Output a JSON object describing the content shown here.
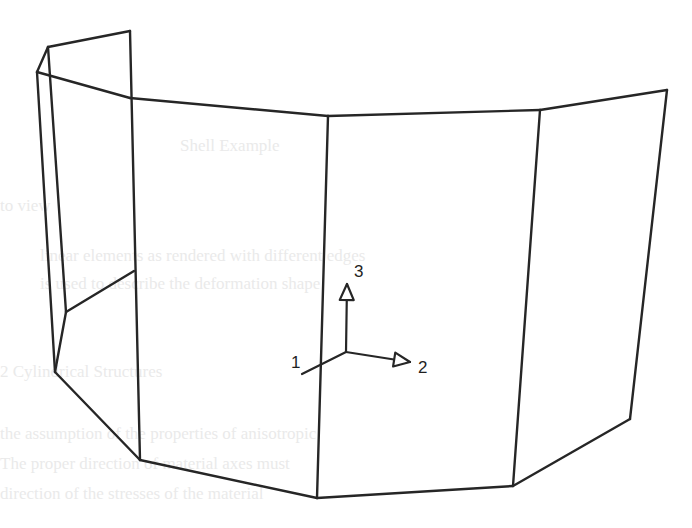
{
  "figure": {
    "type": "wireframe-3d-shell",
    "colors": {
      "line": "#262626",
      "background": "#ffffff",
      "bleed_through_text": "#d9d9d9"
    },
    "axis_triad": {
      "origin": [
        346,
        352
      ],
      "axes": [
        {
          "id": "axis-1",
          "label": "1",
          "end": [
            302,
            374
          ],
          "label_pos": [
            291,
            368
          ]
        },
        {
          "id": "axis-2",
          "label": "2",
          "end": [
            410,
            362
          ],
          "label_pos": [
            418,
            373
          ]
        },
        {
          "id": "axis-3",
          "label": "3",
          "end": [
            347,
            284
          ],
          "label_pos": [
            354,
            277
          ]
        }
      ]
    },
    "edges": [
      {
        "id": "top-flap-left",
        "points": [
          [
            37,
            72
          ],
          [
            48,
            47
          ]
        ]
      },
      {
        "id": "top-flap",
        "points": [
          [
            48,
            47
          ],
          [
            130,
            31
          ]
        ]
      },
      {
        "id": "top-edge-1",
        "points": [
          [
            37,
            72
          ],
          [
            130,
            98
          ]
        ]
      },
      {
        "id": "top-edge-2",
        "points": [
          [
            130,
            98
          ],
          [
            328,
            116
          ]
        ]
      },
      {
        "id": "top-edge-3",
        "points": [
          [
            328,
            116
          ],
          [
            540,
            110
          ]
        ]
      },
      {
        "id": "top-edge-4",
        "points": [
          [
            540,
            110
          ],
          [
            667,
            90
          ]
        ]
      },
      {
        "id": "vertical-0",
        "points": [
          [
            37,
            72
          ],
          [
            55,
            372
          ]
        ]
      },
      {
        "id": "vertical-0b",
        "points": [
          [
            48,
            47
          ],
          [
            66,
            312
          ]
        ]
      },
      {
        "id": "vertical-1",
        "points": [
          [
            130,
            31
          ],
          [
            140,
            460
          ]
        ]
      },
      {
        "id": "vertical-2",
        "points": [
          [
            328,
            116
          ],
          [
            317,
            498
          ]
        ]
      },
      {
        "id": "vertical-3",
        "points": [
          [
            540,
            110
          ],
          [
            513,
            486
          ]
        ]
      },
      {
        "id": "vertical-4",
        "points": [
          [
            667,
            90
          ],
          [
            630,
            419
          ]
        ]
      },
      {
        "id": "inner-diag",
        "points": [
          [
            66,
            312
          ],
          [
            134,
            271
          ]
        ]
      },
      {
        "id": "inner-diag-2",
        "points": [
          [
            66,
            312
          ],
          [
            55,
            372
          ]
        ]
      },
      {
        "id": "bottom-edge-1",
        "points": [
          [
            55,
            372
          ],
          [
            140,
            460
          ]
        ]
      },
      {
        "id": "bottom-edge-2",
        "points": [
          [
            140,
            460
          ],
          [
            317,
            498
          ]
        ]
      },
      {
        "id": "bottom-edge-3",
        "points": [
          [
            317,
            498
          ],
          [
            513,
            486
          ]
        ]
      },
      {
        "id": "bottom-edge-4",
        "points": [
          [
            513,
            486
          ],
          [
            630,
            419
          ]
        ]
      }
    ],
    "bleed_through_text": [
      {
        "text": "Shell Example",
        "x": 180,
        "y": 152
      },
      {
        "text": "to view",
        "x": 0,
        "y": 212
      },
      {
        "text": "linear elements as rendered with different edges",
        "x": 40,
        "y": 262
      },
      {
        "text": "is used to describe the deformation shape",
        "x": 40,
        "y": 290
      },
      {
        "text": "2 Cylindrical Structures",
        "x": 0,
        "y": 378
      },
      {
        "text": "the assumption of the properties of anisotropic",
        "x": 0,
        "y": 440
      },
      {
        "text": "The proper direction of material axes must",
        "x": 0,
        "y": 470
      },
      {
        "text": "direction of the stresses of the material",
        "x": 0,
        "y": 500
      }
    ]
  }
}
